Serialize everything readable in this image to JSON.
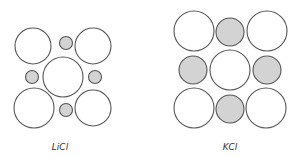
{
  "diagrams": [
    {
      "label": "LiCl",
      "label_pos": [
        60,
        150
      ],
      "ions": [
        {
          "type": "anion",
          "cx": 33,
          "cy": 46,
          "r": 18
        },
        {
          "type": "cation",
          "cx": 66,
          "cy": 43,
          "r": 6.5
        },
        {
          "type": "anion",
          "cx": 93,
          "cy": 46,
          "r": 18
        },
        {
          "type": "cation",
          "cx": 32,
          "cy": 77,
          "r": 6.5
        },
        {
          "type": "anion",
          "cx": 63,
          "cy": 77,
          "r": 20
        },
        {
          "type": "cation",
          "cx": 95,
          "cy": 77,
          "r": 6.5
        },
        {
          "type": "anion",
          "cx": 34,
          "cy": 108,
          "r": 20
        },
        {
          "type": "cation",
          "cx": 66,
          "cy": 110,
          "r": 6.5
        },
        {
          "type": "anion",
          "cx": 93,
          "cy": 108,
          "r": 18
        }
      ]
    },
    {
      "label": "KCl",
      "label_pos": [
        230,
        150
      ],
      "ions": [
        {
          "type": "anion",
          "cx": 194,
          "cy": 31,
          "r": 20
        },
        {
          "type": "cation",
          "cx": 230,
          "cy": 32,
          "r": 14
        },
        {
          "type": "anion",
          "cx": 267,
          "cy": 31,
          "r": 20
        },
        {
          "type": "cation",
          "cx": 193,
          "cy": 70,
          "r": 14
        },
        {
          "type": "anion",
          "cx": 230,
          "cy": 70,
          "r": 20
        },
        {
          "type": "cation",
          "cx": 267,
          "cy": 70,
          "r": 14
        },
        {
          "type": "anion",
          "cx": 194,
          "cy": 108,
          "r": 20
        },
        {
          "type": "cation",
          "cx": 230,
          "cy": 109,
          "r": 14
        },
        {
          "type": "anion",
          "cx": 266,
          "cy": 108,
          "r": 20
        }
      ]
    }
  ],
  "colors": {
    "anion_fill": "#ffffff",
    "cation_fill": "#d3d3d3",
    "stroke": "#555555"
  }
}
